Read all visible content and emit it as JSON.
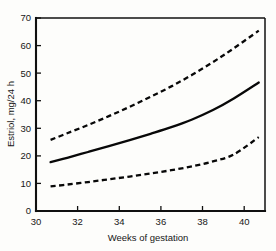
{
  "chart_data": {
    "type": "line",
    "title": "",
    "xlabel": "Weeks of gestation",
    "ylabel": "Estriol, mg/24 h",
    "xlim": [
      30,
      41
    ],
    "ylim": [
      0,
      70
    ],
    "xticks": [
      30,
      32,
      34,
      36,
      38,
      40
    ],
    "yticks": [
      0,
      10,
      20,
      30,
      40,
      50,
      60,
      70
    ],
    "xtick_labels": [
      "30",
      "32",
      "34",
      "36",
      "38",
      "40"
    ],
    "ytick_labels": [
      "0",
      "10",
      "20",
      "30",
      "40",
      "50",
      "60",
      "70"
    ],
    "grid": false,
    "legend": "none",
    "x": [
      30.7,
      31.5,
      32.5,
      33.5,
      34.5,
      35.5,
      36.5,
      37.5,
      38.5,
      39.5,
      40.7
    ],
    "series": [
      {
        "name": "Upper limit (90th percentile)",
        "style": "dashed",
        "values": [
          25.8,
          28.2,
          31.2,
          34.4,
          37.8,
          41.4,
          45.2,
          49.4,
          54.0,
          59.0,
          65.4
        ]
      },
      {
        "name": "Mean estriol",
        "style": "solid",
        "values": [
          17.7,
          19.3,
          21.4,
          23.5,
          25.7,
          28.0,
          30.4,
          33.2,
          36.6,
          40.8,
          46.6
        ]
      },
      {
        "name": "Lower limit (10th percentile)",
        "style": "dashed",
        "values": [
          8.9,
          9.6,
          10.5,
          11.5,
          12.5,
          13.6,
          14.8,
          16.2,
          18.0,
          20.5,
          26.8
        ]
      }
    ]
  },
  "axes": {
    "y_axis_title": "Estriol, mg/24 h",
    "x_axis_title": "Weeks of gestation"
  }
}
